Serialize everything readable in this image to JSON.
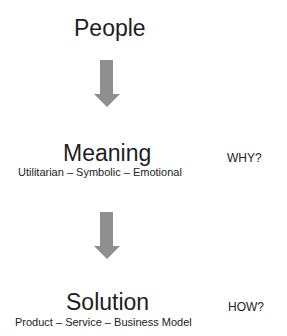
{
  "diagram": {
    "nodes": [
      {
        "id": "people",
        "title": "People"
      },
      {
        "id": "meaning",
        "title": "Meaning",
        "subtitle": "Utilitarian – Symbolic – Emotional",
        "question": "WHY?"
      },
      {
        "id": "solution",
        "title": "Solution",
        "subtitle": "Product – Service – Business Model",
        "question": "HOW?"
      }
    ],
    "edges": [
      {
        "from": "people",
        "to": "meaning"
      },
      {
        "from": "meaning",
        "to": "solution"
      }
    ],
    "colors": {
      "arrow": "#8f8f8f",
      "text": "#1e1e1e",
      "background": "#ffffff"
    }
  }
}
